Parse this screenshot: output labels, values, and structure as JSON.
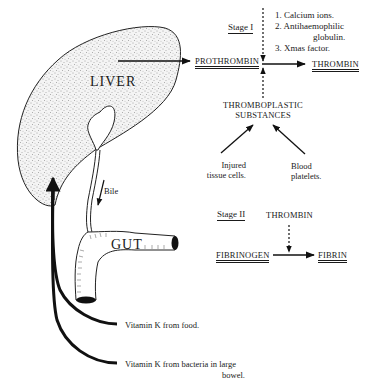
{
  "organs": {
    "liver": "LIVER",
    "gut": "GUT",
    "bile": "Bile"
  },
  "stage1": {
    "label": "Stage I",
    "prothrombin": "PROTHROMBIN",
    "thrombin": "THROMBIN",
    "factors": [
      "1. Calcium ions.",
      "2. Antihaemophilic",
      "globulin.",
      "3. Xmas factor."
    ],
    "thromboplastic_line1": "THROMBOPLASTIC",
    "thromboplastic_line2": "SUBSTANCES",
    "injured_line1": "Injured",
    "injured_line2": "tissue cells.",
    "blood_line1": "Blood",
    "blood_line2": "platelets."
  },
  "stage2": {
    "label": "Stage II",
    "thrombin": "THROMBIN",
    "fibrinogen": "FIBRINOGEN",
    "fibrin": "FIBRIN"
  },
  "vitamin_k": {
    "food": "Vitamin K from food.",
    "bacteria_line1": "Vitamin K from bacteria in large",
    "bacteria_line2": "bowel."
  }
}
